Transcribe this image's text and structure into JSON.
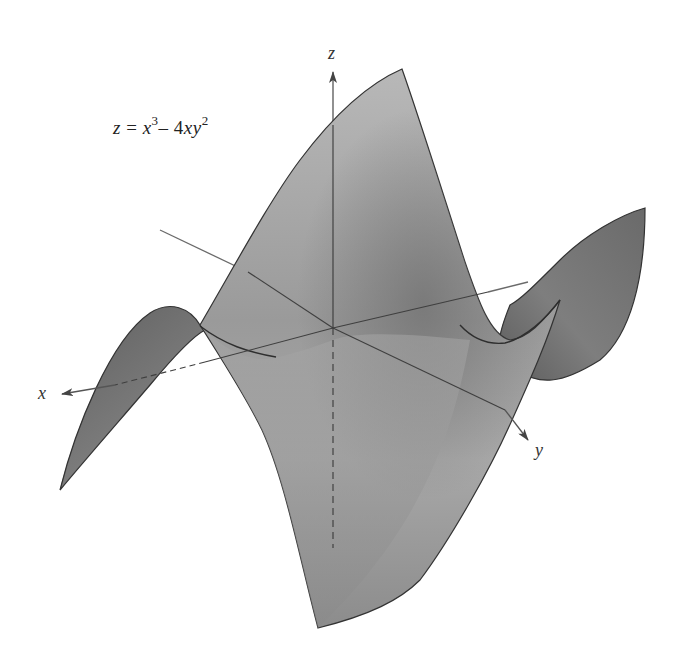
{
  "figure": {
    "equation": {
      "lhs": "z",
      "eq": "=",
      "term1_base": "x",
      "term1_exp": "3",
      "minus": "–",
      "term2_coef": "4",
      "term2_base": "xy",
      "term2_exp": "2",
      "full_text": "z = x³ – 4xy²"
    },
    "axes": {
      "x_label": "x",
      "y_label": "y",
      "z_label": "z"
    },
    "colors": {
      "surface_light": "#b4b4b4",
      "surface_mid": "#9c9c9c",
      "surface_dark": "#6e6e6e",
      "edge": "#3a3a3a",
      "axis": "#555555",
      "background": "#ffffff"
    }
  }
}
